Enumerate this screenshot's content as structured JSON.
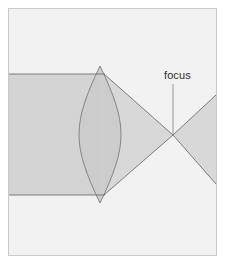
{
  "figure": {
    "type": "optics-ray-diagram",
    "canvas": {
      "width": 226,
      "height": 265
    },
    "background_color": "#ffffff",
    "frame": {
      "visible": true,
      "x": 8,
      "y": 8,
      "width": 209,
      "height": 248,
      "fill": "#f2f2f2",
      "stroke": "#c9c9c9",
      "stroke_width": 1
    },
    "palette": {
      "beam_fill": "#d4d4d4",
      "beam_fill_light": "#dcdcdc",
      "lens_fill": "#cfcfcf",
      "ray_stroke": "#6f6f6f",
      "leader_stroke": "#8a8a8a",
      "text_color": "#2e2e2e"
    },
    "labels": {
      "focus": "focus"
    },
    "leader_line": {
      "name": "focus-leader-line",
      "x1": 173,
      "y1": 84,
      "x2": 173,
      "y2": 135
    },
    "geometry": {
      "incoming_beam": {
        "left_x": 9,
        "top_y": 74,
        "bottom_y": 195,
        "lens_x": 100
      },
      "lens": {
        "center_x": 100,
        "top_tip_y": 66,
        "bottom_tip_y": 203,
        "half_width": 21,
        "left_edge_x": 79,
        "right_edge_x": 121
      },
      "focus_point": {
        "x": 173,
        "y": 135
      },
      "converging_beam": {
        "entry_top_y": 74,
        "entry_bottom_y": 195,
        "entry_x": 105
      },
      "diverging_beam": {
        "right_x": 216,
        "top_y": 95,
        "bottom_y": 184
      }
    }
  }
}
